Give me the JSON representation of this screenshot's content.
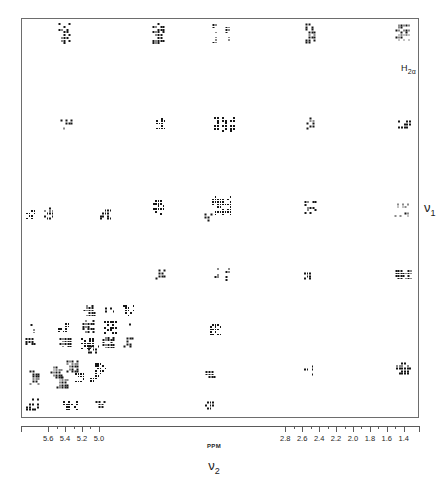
{
  "figure": {
    "kind": "2D NMR COSY contour spectrum",
    "annotation": {
      "text": "H2α",
      "base": "H",
      "sub": "2α"
    },
    "x_axis_title": {
      "base": "ν",
      "sub": "2"
    },
    "y_axis_title": {
      "base": "ν",
      "sub": "1"
    },
    "unit_label": "PPM"
  },
  "chart_data": {
    "type": "scatter",
    "title": "",
    "subtitle": "",
    "xlabel": "ν2",
    "ylabel": "ν1",
    "unit": "PPM",
    "grid": false,
    "legend": "none",
    "axis_direction": "reversed",
    "xlim": [
      5.92,
      1.22
    ],
    "ylim": [
      5.92,
      1.22
    ],
    "xticks": [
      5.6,
      5.4,
      5.2,
      5.0,
      2.8,
      2.6,
      2.4,
      2.2,
      2.0,
      1.8,
      1.6,
      1.4
    ],
    "xticklabels": [
      "5.6",
      "5.4",
      "5.2",
      "5.0",
      "2.8",
      "2.6",
      "2.4",
      "2.2",
      "2.0",
      "1.8",
      "1.6",
      "1.4"
    ],
    "yticks": [],
    "yticklabels": [],
    "annotations": [
      {
        "text": "H2α",
        "x": 1.3,
        "y": 5.6,
        "note": "labels the strong diagonal peak at upper right"
      }
    ],
    "peaks": [
      {
        "x": 64,
        "y": 33,
        "w": 13,
        "h": 22,
        "d": 0.95,
        "label": ""
      },
      {
        "x": 158,
        "y": 33,
        "w": 13,
        "h": 22,
        "d": 0.95,
        "label": ""
      },
      {
        "x": 214,
        "y": 33,
        "w": 5,
        "h": 20,
        "d": 0.7,
        "label": ""
      },
      {
        "x": 227,
        "y": 33,
        "w": 5,
        "h": 20,
        "d": 0.7,
        "label": ""
      },
      {
        "x": 310,
        "y": 33,
        "w": 11,
        "h": 21,
        "d": 0.95,
        "label": ""
      },
      {
        "x": 402,
        "y": 32,
        "w": 15,
        "h": 17,
        "d": 1.0,
        "label": "H2α"
      },
      {
        "x": 66,
        "y": 124,
        "w": 13,
        "h": 11,
        "d": 0.55,
        "label": ""
      },
      {
        "x": 160,
        "y": 123,
        "w": 10,
        "h": 12,
        "d": 0.85,
        "label": ""
      },
      {
        "x": 216,
        "y": 124,
        "w": 6,
        "h": 16,
        "d": 0.85,
        "label": ""
      },
      {
        "x": 224,
        "y": 124,
        "w": 6,
        "h": 16,
        "d": 0.85,
        "label": ""
      },
      {
        "x": 232,
        "y": 124,
        "w": 6,
        "h": 16,
        "d": 0.85,
        "label": ""
      },
      {
        "x": 311,
        "y": 123,
        "w": 11,
        "h": 13,
        "d": 0.85,
        "label": ""
      },
      {
        "x": 404,
        "y": 124,
        "w": 14,
        "h": 9,
        "d": 0.85,
        "label": ""
      },
      {
        "x": 30,
        "y": 214,
        "w": 10,
        "h": 10,
        "d": 0.85,
        "label": ""
      },
      {
        "x": 48,
        "y": 213,
        "w": 10,
        "h": 13,
        "d": 0.95,
        "label": ""
      },
      {
        "x": 105,
        "y": 214,
        "w": 12,
        "h": 11,
        "d": 0.85,
        "label": ""
      },
      {
        "x": 158,
        "y": 207,
        "w": 12,
        "h": 16,
        "d": 0.8,
        "label": ""
      },
      {
        "x": 221,
        "y": 205,
        "w": 20,
        "h": 20,
        "d": 0.9,
        "label": ""
      },
      {
        "x": 208,
        "y": 217,
        "w": 9,
        "h": 9,
        "d": 0.9,
        "label": ""
      },
      {
        "x": 310,
        "y": 207,
        "w": 13,
        "h": 14,
        "d": 0.85,
        "label": ""
      },
      {
        "x": 401,
        "y": 205,
        "w": 15,
        "h": 5,
        "d": 0.65,
        "label": ""
      },
      {
        "x": 401,
        "y": 214,
        "w": 15,
        "h": 5,
        "d": 0.65,
        "label": ""
      },
      {
        "x": 160,
        "y": 274,
        "w": 11,
        "h": 11,
        "d": 0.95,
        "label": ""
      },
      {
        "x": 216,
        "y": 274,
        "w": 5,
        "h": 14,
        "d": 0.85,
        "label": ""
      },
      {
        "x": 227,
        "y": 274,
        "w": 5,
        "h": 14,
        "d": 0.85,
        "label": ""
      },
      {
        "x": 308,
        "y": 274,
        "w": 10,
        "h": 11,
        "d": 0.85,
        "label": ""
      },
      {
        "x": 403,
        "y": 274,
        "w": 17,
        "h": 10,
        "d": 0.9,
        "label": ""
      },
      {
        "x": 89,
        "y": 310,
        "w": 13,
        "h": 12,
        "d": 0.95,
        "label": ""
      },
      {
        "x": 109,
        "y": 311,
        "w": 10,
        "h": 9,
        "d": 0.75,
        "label": ""
      },
      {
        "x": 128,
        "y": 310,
        "w": 12,
        "h": 12,
        "d": 0.85,
        "label": ""
      },
      {
        "x": 32,
        "y": 328,
        "w": 5,
        "h": 10,
        "d": 0.5,
        "label": ""
      },
      {
        "x": 63,
        "y": 327,
        "w": 12,
        "h": 10,
        "d": 0.9,
        "label": ""
      },
      {
        "x": 88,
        "y": 326,
        "w": 13,
        "h": 14,
        "d": 0.95,
        "label": ""
      },
      {
        "x": 110,
        "y": 327,
        "w": 14,
        "h": 14,
        "d": 0.95,
        "label": ""
      },
      {
        "x": 131,
        "y": 327,
        "w": 6,
        "h": 9,
        "d": 0.6,
        "label": ""
      },
      {
        "x": 30,
        "y": 341,
        "w": 11,
        "h": 8,
        "d": 0.95,
        "label": ""
      },
      {
        "x": 65,
        "y": 342,
        "w": 13,
        "h": 10,
        "d": 0.95,
        "label": ""
      },
      {
        "x": 87,
        "y": 343,
        "w": 14,
        "h": 12,
        "d": 0.95,
        "label": ""
      },
      {
        "x": 108,
        "y": 342,
        "w": 13,
        "h": 12,
        "d": 0.95,
        "label": ""
      },
      {
        "x": 128,
        "y": 342,
        "w": 11,
        "h": 11,
        "d": 0.9,
        "label": ""
      },
      {
        "x": 93,
        "y": 349,
        "w": 12,
        "h": 9,
        "d": 0.8,
        "label": ""
      },
      {
        "x": 215,
        "y": 329,
        "w": 12,
        "h": 12,
        "d": 0.9,
        "label": ""
      },
      {
        "x": 34,
        "y": 376,
        "w": 11,
        "h": 17,
        "d": 0.95,
        "label": ""
      },
      {
        "x": 56,
        "y": 372,
        "w": 13,
        "h": 13,
        "d": 0.95,
        "label": ""
      },
      {
        "x": 62,
        "y": 382,
        "w": 13,
        "h": 13,
        "d": 0.95,
        "label": ""
      },
      {
        "x": 72,
        "y": 366,
        "w": 13,
        "h": 13,
        "d": 0.95,
        "label": ""
      },
      {
        "x": 78,
        "y": 376,
        "w": 12,
        "h": 12,
        "d": 0.9,
        "label": ""
      },
      {
        "x": 100,
        "y": 368,
        "w": 12,
        "h": 12,
        "d": 0.95,
        "label": ""
      },
      {
        "x": 94,
        "y": 379,
        "w": 10,
        "h": 10,
        "d": 0.8,
        "label": ""
      },
      {
        "x": 210,
        "y": 375,
        "w": 11,
        "h": 10,
        "d": 0.9,
        "label": ""
      },
      {
        "x": 308,
        "y": 370,
        "w": 10,
        "h": 11,
        "d": 0.4,
        "label": ""
      },
      {
        "x": 403,
        "y": 368,
        "w": 16,
        "h": 13,
        "d": 0.95,
        "label": ""
      },
      {
        "x": 32,
        "y": 404,
        "w": 14,
        "h": 13,
        "d": 0.95,
        "label": ""
      },
      {
        "x": 70,
        "y": 405,
        "w": 16,
        "h": 10,
        "d": 0.95,
        "label": ""
      },
      {
        "x": 100,
        "y": 405,
        "w": 11,
        "h": 10,
        "d": 0.9,
        "label": ""
      },
      {
        "x": 210,
        "y": 405,
        "w": 12,
        "h": 9,
        "d": 0.9,
        "label": ""
      }
    ]
  }
}
